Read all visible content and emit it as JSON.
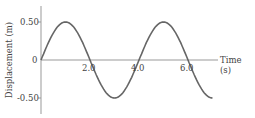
{
  "chart_data": {
    "type": "line",
    "title": "",
    "xlabel": "Time (s)",
    "ylabel": "Displacement (m)",
    "xticks": [
      "2.0",
      "4.0",
      "6.0"
    ],
    "yticks": [
      "0.50",
      "0",
      "-0.50"
    ],
    "xlim": [
      0,
      7.0
    ],
    "ylim": [
      -0.6,
      0.6
    ],
    "grid": false,
    "series": [
      {
        "name": "displacement",
        "function": "0.5*sin(pi*t/2)",
        "x": [
          0,
          0.5,
          1,
          1.5,
          2,
          2.5,
          3,
          3.5,
          4,
          4.5,
          5,
          5.5,
          6,
          6.5,
          7
        ],
        "y": [
          0,
          0.354,
          0.5,
          0.354,
          0,
          -0.354,
          -0.5,
          -0.354,
          0,
          0.354,
          0.5,
          0.354,
          0,
          -0.354,
          -0.5
        ]
      }
    ]
  },
  "labels": {
    "y_top": "0.50",
    "y_zero": "0",
    "y_bottom": "-0.50",
    "x1": "2.0",
    "x2": "4.0",
    "x3": "6.0",
    "xlabel": "Time (s)",
    "ylabel": "Displacement (m)"
  }
}
